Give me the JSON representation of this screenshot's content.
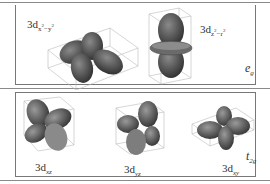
{
  "figure": {
    "top_panel": {
      "group_label": {
        "main": "e",
        "sub": "g"
      },
      "orbitals": [
        {
          "name": "3d_x2-y2",
          "prefix": "3d",
          "sub": "x",
          "sup1": "2",
          "mid": "−y",
          "sup2": "2"
        },
        {
          "name": "3d_z2-r2",
          "prefix": "3d",
          "sub": "z",
          "sup1": "2",
          "mid": "−r",
          "sup2": "2"
        }
      ]
    },
    "bottom_panel": {
      "group_label": {
        "main": "t",
        "sub": "2g"
      },
      "orbitals": [
        {
          "name": "3d_xz",
          "prefix": "3d",
          "sub": "xz"
        },
        {
          "name": "3d_yz",
          "prefix": "3d",
          "sub": "yz"
        },
        {
          "name": "3d_xy",
          "prefix": "3d",
          "sub": "xy"
        }
      ]
    },
    "colors": {
      "lobe_dark": "#3a3a3a",
      "lobe_light": "#9a9a9a",
      "box_line": "#b5b5b5",
      "frame": "#777777"
    }
  }
}
